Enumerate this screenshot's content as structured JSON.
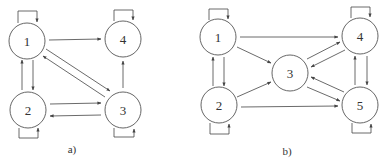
{
  "diagrams": [
    {
      "caption": "a)",
      "nodes": [
        {
          "id": "1",
          "label": "1",
          "x": 27,
          "y": 41
        },
        {
          "id": "2",
          "label": "2",
          "x": 28,
          "y": 110
        },
        {
          "id": "3",
          "label": "3",
          "x": 123,
          "y": 110
        },
        {
          "id": "4",
          "label": "4",
          "x": 123,
          "y": 39
        }
      ],
      "edges": [
        {
          "from": "1",
          "to": "1",
          "type": "self-loop-top"
        },
        {
          "from": "4",
          "to": "4",
          "type": "self-loop-top"
        },
        {
          "from": "2",
          "to": "2",
          "type": "self-loop-bottom"
        },
        {
          "from": "3",
          "to": "3",
          "type": "self-loop-bottom"
        },
        {
          "from": "1",
          "to": "4"
        },
        {
          "from": "1",
          "to": "2"
        },
        {
          "from": "2",
          "to": "1"
        },
        {
          "from": "1",
          "to": "3"
        },
        {
          "from": "3",
          "to": "1"
        },
        {
          "from": "2",
          "to": "3"
        },
        {
          "from": "3",
          "to": "2"
        },
        {
          "from": "3",
          "to": "4"
        }
      ]
    },
    {
      "caption": "b)",
      "nodes": [
        {
          "id": "1",
          "label": "1",
          "x": 218,
          "y": 37
        },
        {
          "id": "2",
          "label": "2",
          "x": 219,
          "y": 105
        },
        {
          "id": "3",
          "label": "3",
          "x": 290,
          "y": 73
        },
        {
          "id": "4",
          "label": "4",
          "x": 360,
          "y": 36
        },
        {
          "id": "5",
          "label": "5",
          "x": 360,
          "y": 105
        }
      ],
      "edges": [
        {
          "from": "1",
          "to": "1",
          "type": "self-loop-top"
        },
        {
          "from": "4",
          "to": "4",
          "type": "self-loop-top"
        },
        {
          "from": "2",
          "to": "2",
          "type": "self-loop-bottom"
        },
        {
          "from": "5",
          "to": "5",
          "type": "self-loop-bottom"
        },
        {
          "from": "1",
          "to": "4"
        },
        {
          "from": "1",
          "to": "3"
        },
        {
          "from": "1",
          "to": "2"
        },
        {
          "from": "2",
          "to": "1"
        },
        {
          "from": "2",
          "to": "3"
        },
        {
          "from": "2",
          "to": "5"
        },
        {
          "from": "3",
          "to": "4"
        },
        {
          "from": "4",
          "to": "3"
        },
        {
          "from": "3",
          "to": "5"
        },
        {
          "from": "5",
          "to": "3"
        },
        {
          "from": "4",
          "to": "5"
        },
        {
          "from": "5",
          "to": "4"
        }
      ]
    }
  ]
}
